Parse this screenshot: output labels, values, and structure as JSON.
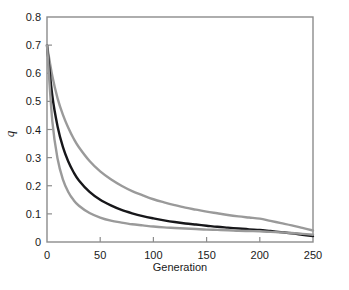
{
  "chart_data": {
    "type": "line",
    "title": "",
    "xlabel": "Generation",
    "ylabel": "q",
    "xlim": [
      0,
      250
    ],
    "ylim": [
      0,
      0.8
    ],
    "xticks": [
      0,
      50,
      100,
      150,
      200,
      250
    ],
    "yticks": [
      0,
      0.1,
      0.2,
      0.3,
      0.4,
      0.5,
      0.6,
      0.7,
      0.8
    ],
    "xtick_labels": [
      "0",
      "50",
      "100",
      "150",
      "200",
      "250"
    ],
    "ytick_labels": [
      "0",
      "0.1",
      "0.2",
      "0.3",
      "0.4",
      "0.5",
      "0.6",
      "0.7",
      "0.8"
    ],
    "grid": false,
    "legend": "none",
    "frame": "box",
    "tick_direction": "in",
    "x": [
      0,
      5,
      10,
      15,
      20,
      25,
      30,
      40,
      50,
      60,
      70,
      80,
      90,
      100,
      110,
      120,
      130,
      140,
      150,
      160,
      170,
      180,
      190,
      200,
      210,
      220,
      230,
      240,
      250
    ],
    "series": [
      {
        "name": "upper",
        "color": "#9a9a9a",
        "width": 2.4,
        "values": [
          0.7,
          0.59,
          0.51,
          0.452,
          0.406,
          0.368,
          0.337,
          0.288,
          0.251,
          0.223,
          0.2,
          0.181,
          0.166,
          0.152,
          0.141,
          0.131,
          0.122,
          0.115,
          0.108,
          0.102,
          0.096,
          0.091,
          0.087,
          0.083,
          0.075,
          0.067,
          0.059,
          0.05,
          0.041
        ]
      },
      {
        "name": "middle",
        "color": "#17171a",
        "width": 2.4,
        "values": [
          0.7,
          0.52,
          0.41,
          0.337,
          0.286,
          0.248,
          0.219,
          0.178,
          0.15,
          0.13,
          0.114,
          0.102,
          0.092,
          0.084,
          0.077,
          0.071,
          0.066,
          0.062,
          0.058,
          0.054,
          0.051,
          0.048,
          0.045,
          0.043,
          0.039,
          0.035,
          0.031,
          0.026,
          0.021
        ]
      },
      {
        "name": "lower",
        "color": "#9a9a9a",
        "width": 2.4,
        "values": [
          0.7,
          0.43,
          0.295,
          0.222,
          0.178,
          0.149,
          0.129,
          0.103,
          0.087,
          0.076,
          0.069,
          0.063,
          0.059,
          0.055,
          0.052,
          0.05,
          0.048,
          0.046,
          0.044,
          0.043,
          0.042,
          0.04,
          0.039,
          0.038,
          0.036,
          0.034,
          0.032,
          0.029,
          0.026
        ]
      }
    ]
  },
  "axes": {
    "frame_color": "#8c8c8c",
    "tick_color": "#8c8c8c",
    "text_color": "#1a1a1a"
  }
}
